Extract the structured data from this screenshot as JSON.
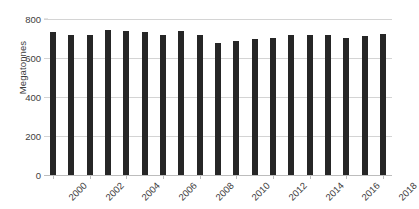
{
  "chart_data": {
    "type": "bar",
    "title": "",
    "subtitle": "",
    "xlabel": "",
    "ylabel": "Megatonnes",
    "categories": [
      "2000",
      "2001",
      "2002",
      "2003",
      "2004",
      "2005",
      "2006",
      "2007",
      "2008",
      "2009",
      "2010",
      "2011",
      "2012",
      "2013",
      "2014",
      "2015",
      "2016",
      "2017",
      "2018"
    ],
    "values": [
      731,
      719,
      720,
      742,
      741,
      731,
      719,
      740,
      719,
      678,
      688,
      700,
      704,
      718,
      718,
      717,
      702,
      712,
      722
    ],
    "ylim": [
      0,
      800
    ],
    "ytick_labels": [
      "0",
      "200",
      "400",
      "600",
      "800"
    ],
    "ytick_values": [
      0,
      200,
      400,
      600,
      800
    ],
    "xtick_labels": [
      "2000",
      "2002",
      "2004",
      "2006",
      "2008",
      "2010",
      "2012",
      "2014",
      "2016",
      "2018"
    ],
    "xtick_categories": [
      "2000",
      "2002",
      "2004",
      "2006",
      "2008",
      "2010",
      "2012",
      "2014",
      "2016",
      "2018"
    ],
    "grid": true,
    "grid_axis": "y",
    "legend": false,
    "legend_position": "none",
    "bar_color": "#262626",
    "grid_color": "#d4d4d4",
    "axis_color": "#bdbdbd",
    "background_color": "#ffffff",
    "xtick_rotation": -45
  }
}
